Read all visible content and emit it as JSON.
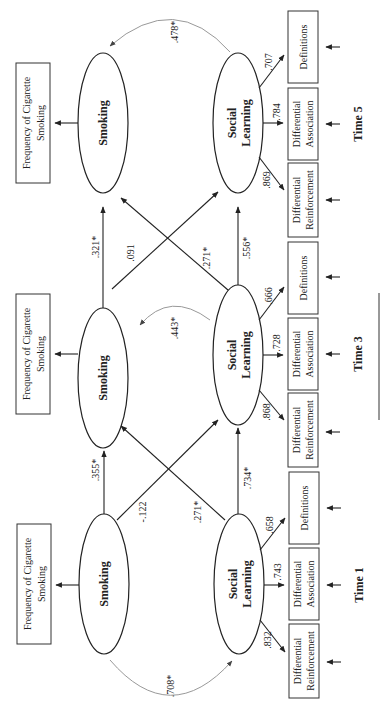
{
  "diagram": {
    "orientation": "rotated-90-ccw",
    "time_points": [
      {
        "id": "t5",
        "label": "Time 5",
        "smoking": "Smoking",
        "social_learning_line1": "Social",
        "social_learning_line2": "Learning",
        "freq_line1": "Frequency of Cigarette",
        "freq_line2": "Smoking",
        "indicators": [
          {
            "line1": "Differential",
            "line2": "Reinforcement",
            "loading": ".869"
          },
          {
            "line1": "Differential",
            "line2": "Association",
            "loading": ".784"
          },
          {
            "line1": "Definitions",
            "line2": "",
            "loading": ".707"
          }
        ],
        "correlation": ".478*"
      },
      {
        "id": "t3",
        "label": "Time 3",
        "smoking": "Smoking",
        "social_learning_line1": "Social",
        "social_learning_line2": "Learning",
        "freq_line1": "Frequency of Cigarette",
        "freq_line2": "Smoking",
        "indicators": [
          {
            "line1": "Differential",
            "line2": "Reinforcement",
            "loading": ".868"
          },
          {
            "line1": "Differential",
            "line2": "Association",
            "loading": ".728"
          },
          {
            "line1": "Definitions",
            "line2": "",
            "loading": ".666"
          }
        ],
        "correlation": ".443*"
      },
      {
        "id": "t1",
        "label": "Time 1",
        "smoking": "Smoking",
        "social_learning_line1": "Social",
        "social_learning_line2": "Learning",
        "freq_line1": "Frequency of Cigarette",
        "freq_line2": "Smoking",
        "indicators": [
          {
            "line1": "Differential",
            "line2": "Reinforcement",
            "loading": ".832"
          },
          {
            "line1": "Differential",
            "line2": "Association",
            "loading": ".743"
          },
          {
            "line1": "Definitions",
            "line2": "",
            "loading": ".658"
          }
        ],
        "correlation": ".708*"
      }
    ],
    "paths_t1_to_t3": {
      "smoking_to_smoking": ".355*",
      "smoking_to_social_learning": "-.122",
      "social_learning_to_smoking": ".271*",
      "social_learning_to_social_learning": ".734*"
    },
    "paths_t3_to_t5": {
      "smoking_to_smoking": ".321*",
      "smoking_to_social_learning": ".091",
      "social_learning_to_smoking": ".271*",
      "social_learning_to_social_learning": ".556*"
    }
  }
}
